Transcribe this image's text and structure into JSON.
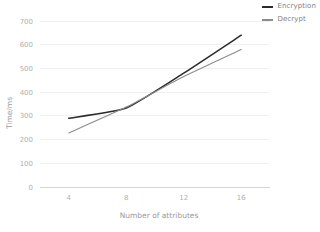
{
  "chart_data": {
    "type": "line",
    "title": "",
    "xlabel": "Number of attributes",
    "ylabel": "Time/ms",
    "x": [
      4,
      8,
      12,
      16
    ],
    "xticks": [
      "4",
      "8",
      "12",
      "16"
    ],
    "yticks": [
      "0",
      "100",
      "200",
      "300",
      "400",
      "500",
      "600",
      "700"
    ],
    "xlim": [
      2,
      18
    ],
    "ylim": [
      0,
      700
    ],
    "grid": true,
    "legend_position": "top-right",
    "series": [
      {
        "name": "Encryption",
        "color": "#2b2b2b",
        "values": [
          290,
          333,
          480,
          640
        ]
      },
      {
        "name": "Decrypt",
        "color": "#8c8c8c",
        "values": [
          228,
          337,
          466,
          580
        ]
      }
    ]
  },
  "axes": {
    "y_label": "Time/ms",
    "x_label": "Number of attributes"
  },
  "colors": {
    "gridline": "#efefef",
    "axis": "#d8d8d8",
    "tick_text": "#b0b0b0",
    "label_text": "#9a9a9a",
    "background": "#ffffff"
  }
}
